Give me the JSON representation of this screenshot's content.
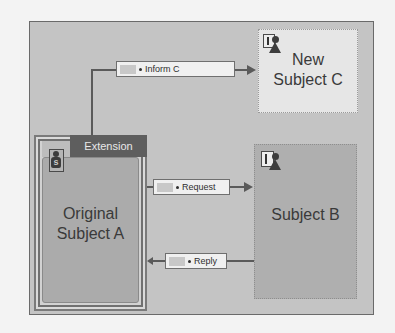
{
  "diagram": {
    "subjects": {
      "new_subject_c": {
        "line1": "New",
        "line2": "Subject C"
      },
      "subject_b": {
        "title": "Subject B"
      },
      "original_subject_a": {
        "line1": "Original",
        "line2": "Subject A"
      }
    },
    "extension": {
      "label": "Extension"
    },
    "messages": {
      "inform_c": "Inform C",
      "request": "Request",
      "reply": "Reply"
    },
    "icons": {
      "subject_a_icon": "s",
      "subject_c_icon": "subject-actor-icon",
      "subject_b_icon": "subject-actor-icon"
    },
    "colors": {
      "frame_bg": "#c4c4c4",
      "subject_c_bg": "#e6e6e6",
      "subject_b_bg": "#afafaf",
      "subject_a_bg": "#ababab",
      "extension_header": "#5e5e5e"
    }
  }
}
